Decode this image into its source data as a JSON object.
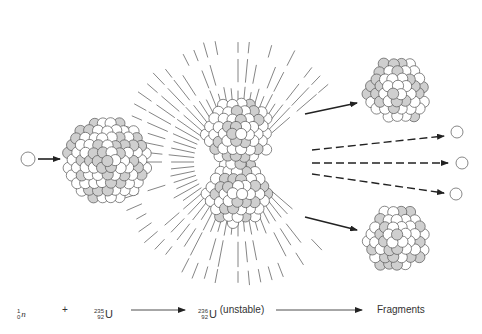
{
  "colors": {
    "stroke": "#555555",
    "shaded": "#cfcfcf",
    "white": "#ffffff",
    "arrow": "#222222",
    "ray": "#666666"
  },
  "equation": {
    "neutron": {
      "mass": "1",
      "atomic": "0",
      "symbol": "n"
    },
    "plus": "+",
    "uranium235": {
      "mass": "235",
      "atomic": "92",
      "symbol": "U"
    },
    "uranium236": {
      "mass": "236",
      "atomic": "92",
      "symbol": "U",
      "note": "(unstable)"
    },
    "result": "Fragments"
  },
  "elements": {
    "incoming_neutron": {
      "cx": 28,
      "cy": 159,
      "r": 7
    },
    "target_nucleus": {
      "cx": 108,
      "cy": 160,
      "r": 44
    },
    "compound_nucleus_top": {
      "cx": 238,
      "cy": 133,
      "r": 36
    },
    "compound_nucleus_bottom": {
      "cx": 238,
      "cy": 192,
      "r": 35
    },
    "fragment_top": {
      "cx": 397,
      "cy": 91,
      "r": 34
    },
    "fragment_bottom": {
      "cx": 397,
      "cy": 239,
      "r": 34
    },
    "released_neutrons": [
      {
        "cx": 457,
        "cy": 132,
        "r": 6
      },
      {
        "cx": 462,
        "cy": 163,
        "r": 6
      },
      {
        "cx": 456,
        "cy": 194,
        "r": 6
      }
    ],
    "ray_center": {
      "cx": 238,
      "cy": 162
    }
  }
}
